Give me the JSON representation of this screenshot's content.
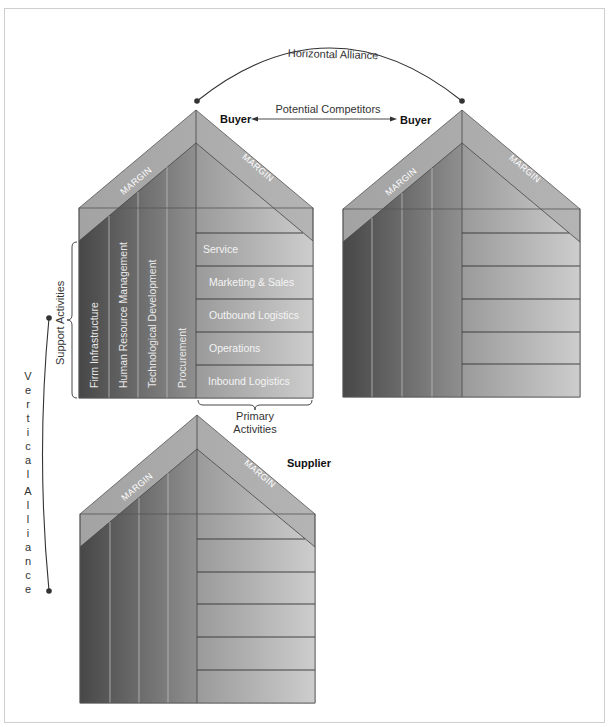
{
  "labels": {
    "horizontal_alliance": "Horizontal Alliance",
    "potential_competitors": "Potential Competitors",
    "buyer_left": "Buyer",
    "buyer_right": "Buyer",
    "supplier": "Supplier",
    "support_activities": "Support Activities",
    "primary_activities_line1": "Primary",
    "primary_activities_line2": "Activities",
    "vertical_alliance_chars": [
      "V",
      "e",
      "r",
      "t",
      "i",
      "c",
      "a",
      "l",
      "",
      "A",
      "l",
      "l",
      "i",
      "a",
      "n",
      "c",
      "e"
    ]
  },
  "margin_label": "MARGIN",
  "support_activities": [
    "Firm Infrastructure",
    "Human Resource Management",
    "Technological Development",
    "Procurement"
  ],
  "primary_activities": [
    "Service",
    "Marketing & Sales",
    "Outbound Logistics",
    "Operations",
    "Inbound Logistics"
  ],
  "colors": {
    "margin_band": "#a9a9a9",
    "support_dark": "#4a4a4a",
    "support_light": "#8e8e8e",
    "primary_dark": "#9c9c9c",
    "primary_light": "#cccccc",
    "line": "#333333"
  }
}
